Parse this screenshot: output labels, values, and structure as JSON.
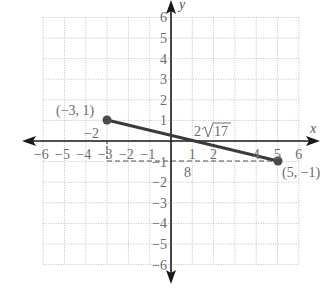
{
  "figure": {
    "x_axis_label": "x",
    "y_axis_label": "y",
    "x_ticks": [
      "−6",
      "−5",
      "−4",
      "−3",
      "−2",
      "−1",
      "1",
      "2",
      "4",
      "5",
      "6"
    ],
    "y_ticks": [
      "6",
      "5",
      "4",
      "3",
      "2",
      "1",
      "−1",
      "−2",
      "−3",
      "−4",
      "−5",
      "−6"
    ],
    "point_a_label": "(−3, 1)",
    "point_b_label": "(5, −1)",
    "vertical_leg_label": "−2",
    "horizontal_leg_label": "8",
    "distance_label": "2√17",
    "distance_radicand": "17",
    "distance_coeff": "2"
  },
  "colors": {
    "grid": "#bdbdbd",
    "axis": "#1a1a1a",
    "segment": "#3a3a3a",
    "label": "#6b6b6b"
  },
  "chart_data": {
    "type": "scatter",
    "title": "",
    "xlabel": "x",
    "ylabel": "y",
    "xlim": [
      -6,
      6
    ],
    "ylim": [
      -6,
      6
    ],
    "grid": true,
    "series": [
      {
        "name": "segment",
        "x": [
          -3,
          5
        ],
        "y": [
          1,
          -1
        ]
      }
    ],
    "annotations": [
      {
        "text": "(−3, 1)",
        "at": [
          -3,
          1
        ]
      },
      {
        "text": "(5, −1)",
        "at": [
          5,
          -1
        ]
      },
      {
        "text": "−2",
        "desc": "vertical leg length"
      },
      {
        "text": "8",
        "desc": "horizontal leg length"
      },
      {
        "text": "2√17",
        "desc": "segment length"
      }
    ]
  }
}
